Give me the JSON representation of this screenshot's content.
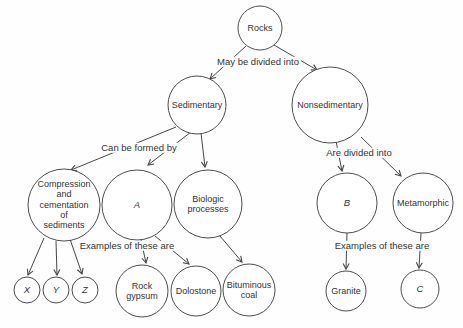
{
  "diagram": {
    "type": "concept-map",
    "background_color": "#fefefe",
    "line_color": "#474747",
    "circle_stroke_color": "#4d4d4d",
    "text_color": "#333333",
    "nodes": [
      {
        "id": "rocks",
        "label": "Rocks",
        "italic": false,
        "x": 260,
        "y": 28,
        "r": 22
      },
      {
        "id": "sedimentary",
        "label": "Sedimentary",
        "italic": false,
        "x": 197,
        "y": 105,
        "r": 29
      },
      {
        "id": "nonsedimentary",
        "label": "Nonsedimentary",
        "italic": false,
        "x": 330,
        "y": 105,
        "r": 38
      },
      {
        "id": "compression",
        "label": "Compression\nand\ncementation\nof\nsediments",
        "italic": false,
        "x": 64,
        "y": 205,
        "r": 36
      },
      {
        "id": "a",
        "label": "A",
        "italic": true,
        "x": 137,
        "y": 205,
        "r": 35
      },
      {
        "id": "biologic",
        "label": "Biologic\nprocesses",
        "italic": false,
        "x": 208,
        "y": 204,
        "r": 34
      },
      {
        "id": "b",
        "label": "B",
        "italic": true,
        "x": 347,
        "y": 203,
        "r": 30
      },
      {
        "id": "metamorphic",
        "label": "Metamorphic",
        "italic": false,
        "x": 423,
        "y": 203,
        "r": 30
      },
      {
        "id": "x",
        "label": "X",
        "italic": true,
        "x": 27,
        "y": 290,
        "r": 13
      },
      {
        "id": "y",
        "label": "Y",
        "italic": true,
        "x": 56,
        "y": 290,
        "r": 13
      },
      {
        "id": "z",
        "label": "Z",
        "italic": true,
        "x": 85,
        "y": 290,
        "r": 13
      },
      {
        "id": "rock-gypsum",
        "label": "Rock\ngypsum",
        "italic": false,
        "x": 142,
        "y": 291,
        "r": 26
      },
      {
        "id": "dolostone",
        "label": "Dolostone",
        "italic": false,
        "x": 196,
        "y": 291,
        "r": 25
      },
      {
        "id": "bituminous-coal",
        "label": "Bituminous\ncoal",
        "italic": false,
        "x": 249,
        "y": 290,
        "r": 26
      },
      {
        "id": "granite",
        "label": "Granite",
        "italic": false,
        "x": 346,
        "y": 291,
        "r": 20
      },
      {
        "id": "c",
        "label": "C",
        "italic": true,
        "x": 420,
        "y": 289,
        "r": 19
      }
    ],
    "edges": [
      {
        "from": "rocks",
        "to": "sedimentary",
        "x1": 246,
        "y1": 46,
        "x2": 210,
        "y2": 79
      },
      {
        "from": "rocks",
        "to": "nonsedimentary",
        "x1": 274,
        "y1": 45,
        "x2": 317,
        "y2": 70
      },
      {
        "from": "sedimentary",
        "to": "compression",
        "x1": 176,
        "y1": 127,
        "x2": 71,
        "y2": 170
      },
      {
        "from": "sedimentary",
        "to": "a",
        "x1": 191,
        "y1": 132,
        "x2": 148,
        "y2": 165
      },
      {
        "from": "sedimentary",
        "to": "biologic",
        "x1": 201,
        "y1": 133,
        "x2": 205,
        "y2": 167
      },
      {
        "from": "nonsedimentary",
        "to": "b",
        "x1": 336,
        "y1": 141,
        "x2": 342,
        "y2": 171
      },
      {
        "from": "nonsedimentary",
        "to": "metamorphic",
        "x1": 361,
        "y1": 137,
        "x2": 401,
        "y2": 176
      },
      {
        "from": "compression",
        "to": "x",
        "x1": 44,
        "y1": 238,
        "x2": 28,
        "y2": 275
      },
      {
        "from": "compression",
        "to": "y",
        "x1": 56,
        "y1": 241,
        "x2": 57,
        "y2": 275
      },
      {
        "from": "compression",
        "to": "z",
        "x1": 70,
        "y1": 239,
        "x2": 82,
        "y2": 274
      },
      {
        "from": "a",
        "to": "rock-gypsum",
        "x1": 141,
        "y1": 240,
        "x2": 146,
        "y2": 263
      },
      {
        "from": "a",
        "to": "dolostone",
        "x1": 155,
        "y1": 236,
        "x2": 189,
        "y2": 264
      },
      {
        "from": "biologic",
        "to": "bituminous-coal",
        "x1": 220,
        "y1": 236,
        "x2": 242,
        "y2": 262
      },
      {
        "from": "b",
        "to": "granite",
        "x1": 347,
        "y1": 233,
        "x2": 346,
        "y2": 269
      },
      {
        "from": "metamorphic",
        "to": "c",
        "x1": 421,
        "y1": 233,
        "x2": 419,
        "y2": 268
      }
    ],
    "edge_labels": [
      {
        "id": "may-be-divided-into",
        "text": "May be divided into",
        "x": 258,
        "y": 62
      },
      {
        "id": "can-be-formed-by",
        "text": "Can be formed by",
        "x": 139,
        "y": 148
      },
      {
        "id": "are-divided-into",
        "text": "Are divided into",
        "x": 359,
        "y": 153
      },
      {
        "id": "examples-of-these-are-left",
        "text": "Examples of these are",
        "x": 127,
        "y": 246
      },
      {
        "id": "examples-of-these-are-right",
        "text": "Examples of these are",
        "x": 382,
        "y": 246
      }
    ]
  }
}
